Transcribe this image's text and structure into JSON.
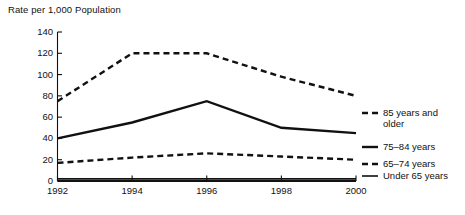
{
  "chart_data": {
    "type": "line",
    "title": "Rate per 1,000 Population",
    "xlabel": "",
    "ylabel": "",
    "x": [
      1992,
      1994,
      1996,
      1998,
      2000
    ],
    "categories": [
      "1992",
      "1994",
      "1996",
      "1998",
      "2000"
    ],
    "xlim": [
      1992,
      2000
    ],
    "ylim": [
      0,
      140
    ],
    "yticks": [
      0,
      20,
      40,
      60,
      80,
      100,
      120,
      140
    ],
    "ytick_labels": [
      "0",
      "20",
      "40",
      "60",
      "80",
      "100",
      "120",
      "140"
    ],
    "xticks": [
      1992,
      1994,
      1996,
      1998,
      2000
    ],
    "xtick_labels": [
      "1992",
      "1994",
      "1996",
      "1998",
      "2000"
    ],
    "grid": false,
    "legend_position": "right",
    "series": [
      {
        "name": "85 years and older",
        "style": "dashed",
        "color": "#111111",
        "values": [
          75,
          120,
          120,
          98,
          80
        ]
      },
      {
        "name": "75–84 years",
        "style": "solid",
        "color": "#111111",
        "values": [
          40,
          55,
          75,
          50,
          45
        ]
      },
      {
        "name": "65–74 years",
        "style": "dashed",
        "color": "#111111",
        "values": [
          17,
          22,
          26,
          23,
          20
        ]
      },
      {
        "name": "Under 65 years",
        "style": "solid",
        "color": "#111111",
        "values": [
          2,
          2,
          2,
          2,
          2
        ]
      }
    ]
  },
  "legend": {
    "entries": [
      {
        "label_line1": "85 years and",
        "label_line2": "older",
        "style": "dashed"
      },
      {
        "label_line1": "75–84 years",
        "label_line2": "",
        "style": "solid"
      },
      {
        "label_line1": "65–74 years",
        "label_line2": "",
        "style": "dashed"
      },
      {
        "label_line1": "Under 65 years",
        "label_line2": "",
        "style": "solid"
      }
    ]
  },
  "colors": {
    "ink": "#111111",
    "background": "#ffffff"
  }
}
